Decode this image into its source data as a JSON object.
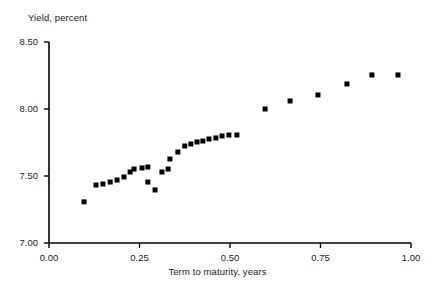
{
  "chart_data": {
    "type": "scatter",
    "title": "",
    "ylabel": "Yield, percent",
    "xlabel": "Term to maturity, years",
    "xlim": [
      0.0,
      1.0
    ],
    "ylim": [
      7.0,
      8.5
    ],
    "xticks": [
      "0.00",
      "0.25",
      "0.50",
      "0.75",
      "1.00"
    ],
    "xtick_values": [
      0.0,
      0.25,
      0.5,
      0.75,
      1.0
    ],
    "yticks": [
      "7.00",
      "7.50",
      "8.00",
      "8.50"
    ],
    "ytick_values": [
      7.0,
      7.5,
      8.0,
      8.5
    ],
    "grid": false,
    "legend": null,
    "marker": "square",
    "marker_color": "#000000",
    "series": [
      {
        "name": "Yield curve",
        "points": [
          {
            "x": 0.097,
            "y": 7.307
          },
          {
            "x": 0.13,
            "y": 7.433
          },
          {
            "x": 0.149,
            "y": 7.44
          },
          {
            "x": 0.169,
            "y": 7.455
          },
          {
            "x": 0.188,
            "y": 7.47
          },
          {
            "x": 0.207,
            "y": 7.493
          },
          {
            "x": 0.224,
            "y": 7.53
          },
          {
            "x": 0.235,
            "y": 7.552
          },
          {
            "x": 0.257,
            "y": 7.56
          },
          {
            "x": 0.273,
            "y": 7.567
          },
          {
            "x": 0.273,
            "y": 7.455
          },
          {
            "x": 0.293,
            "y": 7.396
          },
          {
            "x": 0.312,
            "y": 7.53
          },
          {
            "x": 0.329,
            "y": 7.552
          },
          {
            "x": 0.334,
            "y": 7.627
          },
          {
            "x": 0.356,
            "y": 7.679
          },
          {
            "x": 0.375,
            "y": 7.724
          },
          {
            "x": 0.392,
            "y": 7.739
          },
          {
            "x": 0.409,
            "y": 7.754
          },
          {
            "x": 0.425,
            "y": 7.761
          },
          {
            "x": 0.442,
            "y": 7.776
          },
          {
            "x": 0.461,
            "y": 7.784
          },
          {
            "x": 0.478,
            "y": 7.799
          },
          {
            "x": 0.497,
            "y": 7.806
          },
          {
            "x": 0.519,
            "y": 7.806
          },
          {
            "x": 0.597,
            "y": 8.0
          },
          {
            "x": 0.666,
            "y": 8.06
          },
          {
            "x": 0.743,
            "y": 8.105
          },
          {
            "x": 0.823,
            "y": 8.187
          },
          {
            "x": 0.892,
            "y": 8.254
          },
          {
            "x": 0.964,
            "y": 8.254
          }
        ]
      }
    ]
  }
}
